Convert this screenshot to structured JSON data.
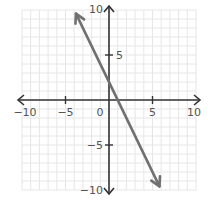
{
  "chart_data": {
    "type": "line",
    "title": "",
    "xlabel": "",
    "ylabel": "",
    "xlim": [
      -10,
      10
    ],
    "ylim": [
      -10,
      10
    ],
    "grid": true,
    "grid_minor_step": 1,
    "x_ticks": [
      -10,
      -5,
      0,
      5,
      10
    ],
    "y_ticks": [
      -10,
      -5,
      5,
      10
    ],
    "x_tick_labels": [
      "−10",
      "−5",
      "0",
      "5",
      "10"
    ],
    "y_tick_labels": [
      "−10",
      "−5",
      "5",
      "10"
    ],
    "series": [
      {
        "name": "line",
        "equation": "y = -2x + 2",
        "slope": -2,
        "intercept": 2,
        "x": [
          -3.8,
          5.8
        ],
        "y": [
          9.6,
          -9.6
        ],
        "arrows_both_ends": true,
        "color": "#707070"
      }
    ],
    "legend": null
  },
  "colors": {
    "axis": "#333333",
    "grid": "#e6e6e6",
    "line": "#707070",
    "label": "#555555"
  }
}
